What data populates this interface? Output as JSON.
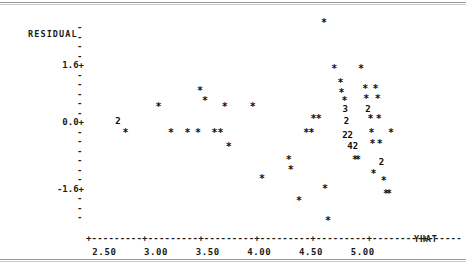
{
  "chart_data": {
    "type": "scatter",
    "title": "",
    "subtitle": "",
    "ylabel": "RESIDUAL",
    "xlabel": "YHAT",
    "xlim": [
      2.38,
      5.4
    ],
    "ylim": [
      -2.6,
      2.7
    ],
    "xticks": [
      "2.50",
      "3.00",
      "3.50",
      "4.00",
      "4.50",
      "5.00"
    ],
    "xtick_values": [
      2.5,
      3.0,
      3.5,
      4.0,
      4.5,
      5.0
    ],
    "yticks": [
      "1.6+",
      "0.0+",
      "-1.6+"
    ],
    "ytick_values": [
      1.6,
      0.0,
      -1.6
    ],
    "ytick_minor_count": 19,
    "grid": false,
    "legend": null,
    "marker": "*",
    "overplot_labels": "Digits 2, 3, 4 mark coincident points (count of observations at that location).",
    "points": [
      {
        "x": 2.63,
        "y": 0.12,
        "label": "2",
        "n": 2
      },
      {
        "x": 2.7,
        "y": -0.22,
        "label": "*",
        "n": 1
      },
      {
        "x": 3.02,
        "y": 0.42,
        "label": "*",
        "n": 1
      },
      {
        "x": 3.14,
        "y": -0.22,
        "label": "*",
        "n": 1
      },
      {
        "x": 3.3,
        "y": -0.22,
        "label": "*",
        "n": 1
      },
      {
        "x": 3.4,
        "y": -0.22,
        "label": "*",
        "n": 1
      },
      {
        "x": 3.42,
        "y": 0.82,
        "label": "*",
        "n": 1
      },
      {
        "x": 3.47,
        "y": 0.58,
        "label": "*",
        "n": 1
      },
      {
        "x": 3.56,
        "y": -0.22,
        "label": "*",
        "n": 1
      },
      {
        "x": 3.62,
        "y": -0.22,
        "label": "*",
        "n": 1
      },
      {
        "x": 3.66,
        "y": 0.42,
        "label": "*",
        "n": 1
      },
      {
        "x": 3.7,
        "y": -0.58,
        "label": "*",
        "n": 1
      },
      {
        "x": 3.93,
        "y": 0.42,
        "label": "*",
        "n": 1
      },
      {
        "x": 4.02,
        "y": -1.38,
        "label": "*",
        "n": 1
      },
      {
        "x": 4.28,
        "y": -0.9,
        "label": "*",
        "n": 1
      },
      {
        "x": 4.3,
        "y": -1.15,
        "label": "*",
        "n": 1
      },
      {
        "x": 4.38,
        "y": -1.92,
        "label": "*",
        "n": 1
      },
      {
        "x": 4.45,
        "y": -0.22,
        "label": "*",
        "n": 1
      },
      {
        "x": 4.5,
        "y": -0.22,
        "label": "*",
        "n": 1
      },
      {
        "x": 4.52,
        "y": 0.12,
        "label": "*",
        "n": 1
      },
      {
        "x": 4.57,
        "y": 0.12,
        "label": "*",
        "n": 1
      },
      {
        "x": 4.62,
        "y": 2.52,
        "label": "*",
        "n": 1
      },
      {
        "x": 4.63,
        "y": -1.62,
        "label": "*",
        "n": 1
      },
      {
        "x": 4.66,
        "y": -2.42,
        "label": "*",
        "n": 1
      },
      {
        "x": 4.72,
        "y": 1.38,
        "label": "*",
        "n": 1
      },
      {
        "x": 4.78,
        "y": 1.02,
        "label": "*",
        "n": 1
      },
      {
        "x": 4.79,
        "y": 0.78,
        "label": "*",
        "n": 1
      },
      {
        "x": 4.82,
        "y": 0.58,
        "label": "*",
        "n": 1
      },
      {
        "x": 4.83,
        "y": 0.42,
        "label": "3",
        "n": 3
      },
      {
        "x": 4.84,
        "y": 0.12,
        "label": "2",
        "n": 2
      },
      {
        "x": 4.85,
        "y": -0.22,
        "label": "22",
        "n": 4
      },
      {
        "x": 4.9,
        "y": -0.5,
        "label": "42",
        "n": 6
      },
      {
        "x": 4.92,
        "y": -0.9,
        "label": "*",
        "n": 1
      },
      {
        "x": 4.95,
        "y": -0.9,
        "label": "*",
        "n": 1
      },
      {
        "x": 4.98,
        "y": 1.38,
        "label": "*",
        "n": 1
      },
      {
        "x": 5.02,
        "y": 0.88,
        "label": "*",
        "n": 1
      },
      {
        "x": 5.03,
        "y": 0.62,
        "label": "*",
        "n": 1
      },
      {
        "x": 5.05,
        "y": 0.42,
        "label": "2",
        "n": 2
      },
      {
        "x": 5.07,
        "y": 0.12,
        "label": "*",
        "n": 1
      },
      {
        "x": 5.08,
        "y": -0.22,
        "label": "*",
        "n": 1
      },
      {
        "x": 5.09,
        "y": -0.5,
        "label": "*",
        "n": 1
      },
      {
        "x": 5.1,
        "y": -1.25,
        "label": "*",
        "n": 1
      },
      {
        "x": 5.12,
        "y": 0.88,
        "label": "*",
        "n": 1
      },
      {
        "x": 5.14,
        "y": 0.62,
        "label": "*",
        "n": 1
      },
      {
        "x": 5.15,
        "y": 0.12,
        "label": "*",
        "n": 1
      },
      {
        "x": 5.16,
        "y": -0.5,
        "label": "*",
        "n": 1
      },
      {
        "x": 5.18,
        "y": -0.9,
        "label": "2",
        "n": 2
      },
      {
        "x": 5.2,
        "y": -1.42,
        "label": "*",
        "n": 1
      },
      {
        "x": 5.22,
        "y": -1.75,
        "label": "*",
        "n": 1
      },
      {
        "x": 5.25,
        "y": -1.75,
        "label": "*",
        "n": 1
      },
      {
        "x": 5.27,
        "y": -0.22,
        "label": "*",
        "n": 1
      }
    ]
  },
  "axes": {
    "y_axis_label": "RESIDUAL",
    "x_axis_label": "YHAT",
    "y_tick_glyph": "-",
    "y_major_glyph": "+",
    "x_axis_line": "+---------+---------+---------+---------+---------+---------+------",
    "y_tick_labels": [
      {
        "text": "1.6+",
        "value": 1.6
      },
      {
        "text": "0.0+",
        "value": 0.0
      },
      {
        "text": "-1.6+",
        "value": -1.6
      }
    ],
    "x_tick_labels": [
      {
        "text": "2.50",
        "value": 2.5
      },
      {
        "text": "3.00",
        "value": 3.0
      },
      {
        "text": "3.50",
        "value": 3.5
      },
      {
        "text": "4.00",
        "value": 4.0
      },
      {
        "text": "4.50",
        "value": 4.5
      },
      {
        "text": "5.00",
        "value": 5.0
      }
    ]
  },
  "style": {
    "ink": "#1a1a1a",
    "paper": "#ffffff",
    "rule": "#9a9a9a"
  }
}
